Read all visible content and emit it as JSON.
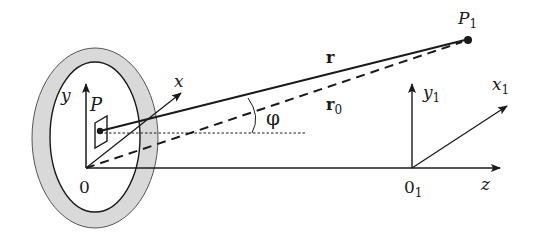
{
  "figure": {
    "colors": {
      "ring_fill": "#d9d9d9",
      "stroke": "#1a1a1a",
      "background": "#ffffff"
    }
  },
  "labels": {
    "source_axis_y": "y",
    "source_axis_x": "x",
    "source_origin": "0",
    "point_P": "P",
    "observer_point": "P",
    "observer_point_sub": "1",
    "vector_r": "r",
    "vector_r0": "r",
    "vector_r0_sub": "0",
    "angle": "φ",
    "obs_axis_y": "y",
    "obs_axis_y_sub": "1",
    "obs_axis_x": "x",
    "obs_axis_x_sub": "1",
    "obs_origin": "0",
    "obs_origin_sub": "1",
    "axis_z": "z"
  }
}
